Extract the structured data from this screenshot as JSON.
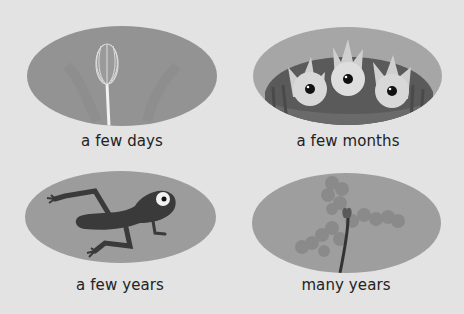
{
  "panels": [
    {
      "caption": "a few days",
      "illustration": "dandelion-seedhead-icon"
    },
    {
      "caption": "a few months",
      "illustration": "baby-birds-in-nest-icon"
    },
    {
      "caption": "a few years",
      "illustration": "frog-icon"
    },
    {
      "caption": "many years",
      "illustration": "tree-sapling-icon"
    }
  ],
  "colors": {
    "background": "#e3e3e3",
    "oval": "#9e9e9e",
    "oval_dark": "#8a8a8a",
    "ink": "#3a3a3a",
    "caption": "#222222"
  }
}
